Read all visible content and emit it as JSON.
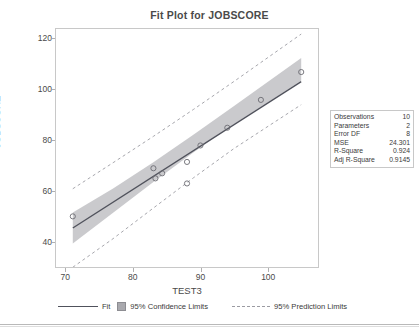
{
  "chart_data": {
    "type": "scatter",
    "title": "Fit Plot for JOBSCORE",
    "xlabel": "TEST3",
    "ylabel": "JOBSCORE",
    "xlim": [
      68.5,
      107.5
    ],
    "ylim": [
      30,
      124
    ],
    "xticks": [
      70,
      80,
      90,
      100
    ],
    "yticks": [
      40,
      60,
      80,
      100,
      120
    ],
    "grid": false,
    "legend_position": "bottom",
    "points": [
      {
        "x": 71.0,
        "y": 50.0
      },
      {
        "x": 83.0,
        "y": 69.0
      },
      {
        "x": 83.3,
        "y": 65.0
      },
      {
        "x": 84.3,
        "y": 67.0
      },
      {
        "x": 88.0,
        "y": 71.5
      },
      {
        "x": 88.0,
        "y": 63.0
      },
      {
        "x": 90.0,
        "y": 78.0
      },
      {
        "x": 94.0,
        "y": 85.0
      },
      {
        "x": 99.0,
        "y": 96.0
      },
      {
        "x": 105.0,
        "y": 107.0
      }
    ],
    "fit_line": {
      "x": [
        71.0,
        105.0
      ],
      "y": [
        45.4,
        103.2
      ]
    },
    "confidence_band": {
      "x": [
        71.0,
        77.0,
        83.0,
        89.0,
        95.0,
        105.0
      ],
      "upper": [
        51.5,
        61.0,
        71.4,
        82.3,
        93.6,
        112.5
      ],
      "lower": [
        39.3,
        51.4,
        63.6,
        75.3,
        86.5,
        103.6
      ]
    },
    "prediction_band": {
      "x": [
        71.0,
        77.0,
        83.0,
        89.0,
        95.0,
        105.0
      ],
      "upper": [
        60.9,
        71.2,
        81.6,
        92.3,
        103.3,
        122.0
      ],
      "lower": [
        29.9,
        41.2,
        53.3,
        65.3,
        76.8,
        94.1
      ]
    },
    "series_names": [
      "Fit",
      "95% Confidence Limits",
      "95% Prediction Limits"
    ],
    "marker": "open-circle",
    "colors": {
      "fit_line": "#50525c",
      "confidence_band": "#a9a9ae",
      "prediction_line": "#9b9ba2",
      "marker": "#6b6b72",
      "axis": "#c8c8c8",
      "text": "#4a4a4a"
    }
  },
  "legend": {
    "fit_label": "Fit",
    "confidence_label": "95% Confidence Limits",
    "prediction_label": "95% Prediction Limits"
  },
  "stats": {
    "rows": [
      {
        "key": "Observations",
        "value": "10"
      },
      {
        "key": "Parameters",
        "value": "2"
      },
      {
        "key": "Error DF",
        "value": "8"
      },
      {
        "key": "MSE",
        "value": "24.301"
      },
      {
        "key": "R-Square",
        "value": "0.924"
      },
      {
        "key": "Adj R-Square",
        "value": "0.9145"
      }
    ]
  }
}
